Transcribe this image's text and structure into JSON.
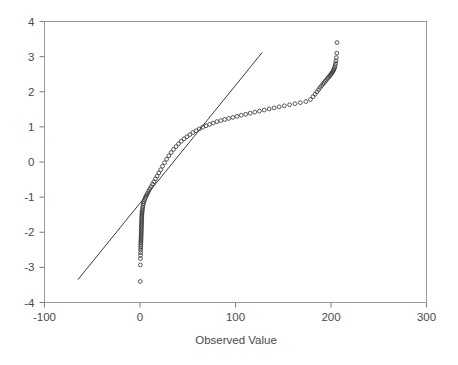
{
  "chart_data": {
    "type": "scatter",
    "title": "",
    "subtitle": "",
    "xlabel": "Observed Value",
    "ylabel": "",
    "xlim": [
      -100,
      300
    ],
    "ylim": [
      -4,
      4
    ],
    "xticks": [
      -100,
      0,
      100,
      200,
      300
    ],
    "xtick_labels": [
      "-100",
      "0",
      "100",
      "200",
      "300"
    ],
    "yticks": [
      -4,
      -3,
      -2,
      -1,
      0,
      1,
      2,
      3,
      4
    ],
    "ytick_labels": [
      "-4",
      "-3",
      "-2",
      "-1",
      "0",
      "1",
      "2",
      "3",
      "4"
    ],
    "grid": false,
    "legend": null,
    "legend_position": "none",
    "marker": "open-circle",
    "marker_color": "#3a3a3a",
    "series": [
      {
        "name": "Observed vs Expected Normal",
        "type": "scatter",
        "x": [
          0.3,
          0.4,
          0.5,
          0.5,
          0.6,
          0.7,
          0.7,
          0.8,
          0.9,
          0.9,
          1.0,
          1.0,
          1.1,
          1.1,
          1.2,
          1.2,
          1.3,
          1.3,
          1.4,
          1.4,
          1.5,
          1.5,
          1.6,
          1.6,
          1.7,
          1.7,
          1.8,
          1.8,
          1.9,
          2.0,
          2.1,
          2.2,
          2.4,
          2.6,
          2.9,
          3.2,
          3.6,
          4.1,
          4.7,
          5.4,
          6.2,
          7.1,
          8.1,
          9.2,
          10.4,
          11.7,
          13.1,
          14.6,
          16.2,
          17.9,
          19.7,
          21.6,
          23.6,
          25.7,
          27.9,
          30.2,
          32.6,
          35.1,
          37.7,
          40.4,
          43.2,
          46.1,
          49.1,
          52.2,
          55.4,
          58.7,
          62.1,
          65.6,
          69.2,
          72.9,
          76.7,
          80.6,
          84.6,
          88.7,
          92.9,
          97.2,
          101.6,
          106.1,
          110.7,
          115.4,
          120.2,
          125.1,
          130.1,
          135.2,
          140.4,
          145.7,
          151.1,
          156.6,
          162.2,
          167.9,
          173.7,
          178.5,
          181.2,
          183.4,
          185.3,
          187.0,
          188.6,
          190.1,
          191.5,
          192.8,
          194.0,
          195.2,
          196.3,
          197.3,
          198.3,
          199.2,
          200.0,
          200.8,
          201.5,
          202.2,
          202.8,
          203.4,
          203.9,
          204.4,
          204.8,
          205.2,
          205.6,
          206.0,
          206.3
        ],
        "y": [
          -3.4,
          -2.93,
          -2.75,
          -2.66,
          -2.58,
          -2.51,
          -2.45,
          -2.4,
          -2.35,
          -2.3,
          -2.26,
          -2.22,
          -2.18,
          -2.14,
          -2.1,
          -2.06,
          -2.02,
          -1.98,
          -1.94,
          -1.9,
          -1.86,
          -1.82,
          -1.78,
          -1.74,
          -1.7,
          -1.66,
          -1.62,
          -1.58,
          -1.54,
          -1.5,
          -1.46,
          -1.42,
          -1.38,
          -1.33,
          -1.28,
          -1.23,
          -1.18,
          -1.13,
          -1.08,
          -1.03,
          -0.98,
          -0.93,
          -0.88,
          -0.82,
          -0.76,
          -0.7,
          -0.63,
          -0.56,
          -0.48,
          -0.4,
          -0.31,
          -0.22,
          -0.12,
          -0.02,
          0.08,
          0.18,
          0.27,
          0.36,
          0.44,
          0.52,
          0.59,
          0.66,
          0.72,
          0.78,
          0.84,
          0.89,
          0.94,
          0.99,
          1.03,
          1.07,
          1.11,
          1.15,
          1.18,
          1.21,
          1.24,
          1.27,
          1.3,
          1.33,
          1.36,
          1.39,
          1.42,
          1.45,
          1.48,
          1.51,
          1.54,
          1.57,
          1.6,
          1.63,
          1.66,
          1.69,
          1.72,
          1.78,
          1.86,
          1.93,
          2.0,
          2.06,
          2.12,
          2.17,
          2.22,
          2.26,
          2.3,
          2.34,
          2.38,
          2.41,
          2.44,
          2.47,
          2.5,
          2.53,
          2.56,
          2.59,
          2.62,
          2.66,
          2.7,
          2.75,
          2.81,
          2.88,
          2.97,
          3.1,
          3.4
        ]
      }
    ],
    "reference_line": {
      "name": "normal-reference-line",
      "x_start": -65,
      "y_start": -3.35,
      "x_end": 128,
      "y_end": 3.12,
      "color": "#3c3c3c"
    }
  }
}
